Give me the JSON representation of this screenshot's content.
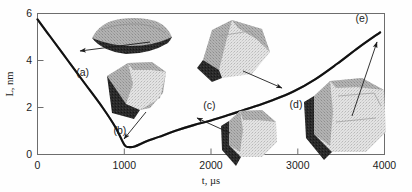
{
  "figure": {
    "name": "nanocrystal-size-evolution-plot",
    "background": "#fefefe"
  },
  "chart_data": {
    "type": "line",
    "title": "",
    "xlabel": "t, µs",
    "ylabel": "L, nm",
    "xlim": [
      0,
      4000
    ],
    "ylim": [
      0,
      6
    ],
    "grid": false,
    "legend_position": "none",
    "xticks": [
      0,
      1000,
      2000,
      3000,
      4000
    ],
    "xtick_labels": [
      "0",
      "1000",
      "2000",
      "3000",
      "4000"
    ],
    "yticks": [
      0,
      2,
      4,
      6
    ],
    "ytick_labels": [
      "0",
      "2",
      "4",
      "6"
    ],
    "series": [
      {
        "name": "L(t)",
        "x": [
          0,
          150,
          350,
          550,
          750,
          900,
          1000,
          1050,
          1120,
          1250,
          1400,
          1600,
          1800,
          2000,
          2200,
          2450,
          2700,
          2950,
          3200,
          3450,
          3700,
          3950
        ],
        "values": [
          5.75,
          5.0,
          4.0,
          3.0,
          2.0,
          1.15,
          0.42,
          0.32,
          0.34,
          0.55,
          0.75,
          1.02,
          1.25,
          1.45,
          1.68,
          1.98,
          2.3,
          2.68,
          3.2,
          3.85,
          4.55,
          5.2
        ]
      }
    ],
    "annotations": [
      {
        "id": "a",
        "label": "(a)",
        "x_data": 520,
        "y_data": 3.35,
        "marker_x": 640,
        "marker_y": 3.72
      },
      {
        "id": "b",
        "label": "(b)",
        "x_data": 950,
        "y_data": 0.88,
        "marker_x": 1070,
        "marker_y": 0.35
      },
      {
        "id": "c",
        "label": "(c)",
        "x_data": 1980,
        "y_data": 1.95,
        "marker_x": 2260,
        "marker_y": 1.72
      },
      {
        "id": "d",
        "label": "(d)",
        "x_data": 2980,
        "y_data": 1.98,
        "marker_x": 2900,
        "marker_y": 2.56
      },
      {
        "id": "e",
        "label": "(e)",
        "x_data": 3740,
        "y_data": 5.62,
        "marker_x": 3930,
        "marker_y": 5.22
      }
    ]
  },
  "snapshots": [
    {
      "id": "a",
      "name": "nanocrystal-snapshot-a",
      "shape": "flat-lens-disc"
    },
    {
      "id": "b",
      "name": "nanocrystal-snapshot-b",
      "shape": "faceted-wedge"
    },
    {
      "id": "c",
      "name": "nanocrystal-snapshot-c",
      "shape": "rounded-polyhedron"
    },
    {
      "id": "d",
      "name": "nanocrystal-snapshot-d",
      "shape": "tilted-prism"
    },
    {
      "id": "e",
      "name": "nanocrystal-snapshot-e",
      "shape": "large-faceted-block"
    }
  ]
}
